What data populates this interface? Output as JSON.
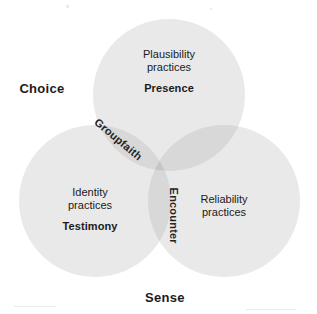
{
  "figure": {
    "type": "venn-diagram-3-set",
    "width": 317,
    "height": 314,
    "background": "#ffffff"
  },
  "colors": {
    "circle_fill": "#e9e9e9",
    "pair_overlap_fill": "#d8d8d8",
    "triple_overlap_fill": "#c6c6c6",
    "text": "#1b1b1b",
    "page_background": "#ffffff"
  },
  "sets": [
    {
      "id": "top",
      "axis_label": "",
      "practice_line1": "Plausibility",
      "practice_line2": "practices",
      "virtue": "Presence",
      "cx": 169,
      "cy": 95,
      "r": 76
    },
    {
      "id": "left",
      "axis_label": "Choice",
      "practice_line1": "Identity",
      "practice_line2": "practices",
      "virtue": "Testimony",
      "cx": 95,
      "cy": 201,
      "r": 76
    },
    {
      "id": "right",
      "axis_label": "Sense",
      "practice_line1": "Reliability",
      "practice_line2": "practices",
      "virtue": "",
      "cx": 224,
      "cy": 201,
      "r": 76
    }
  ],
  "axis_labels": {
    "choice": "Choice",
    "sense": "Sense"
  },
  "overlaps": [
    {
      "id": "top-left",
      "label": "Groupfaith",
      "rotation_deg": 40
    },
    {
      "id": "left-right",
      "label": "Encounter",
      "rotation_deg": 90
    },
    {
      "id": "top-right",
      "label": ""
    }
  ],
  "overlap_labels": {
    "groupfaith": "Groupfaith",
    "encounter": "Encounter"
  }
}
